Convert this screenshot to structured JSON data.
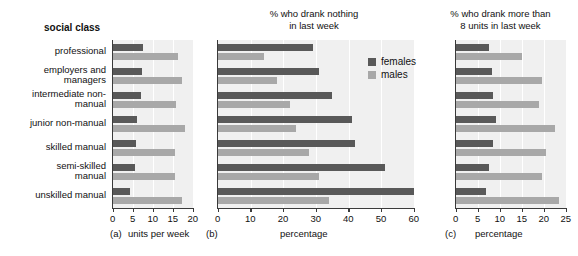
{
  "figure": {
    "categories": [
      "professional",
      "employers and managers",
      "intermediate non-manual",
      "junior non-manual",
      "skilled manual",
      "semi-skilled manual",
      "unskilled manual"
    ],
    "social_class_heading": "social class",
    "legend": {
      "females_label": "females",
      "males_label": "males",
      "females_color": "#595959",
      "males_color": "#a8a8a8"
    }
  },
  "chart_data": [
    {
      "type": "bar",
      "panel": "(a)",
      "title": "social class",
      "orientation": "horizontal",
      "categories": [
        "professional",
        "employers and managers",
        "intermediate non-manual",
        "junior non-manual",
        "skilled manual",
        "semi-skilled manual",
        "unskilled manual"
      ],
      "series": [
        {
          "name": "females",
          "values": [
            7.6,
            7.3,
            7.0,
            6.0,
            5.7,
            5.5,
            4.3
          ]
        },
        {
          "name": "males",
          "values": [
            16.3,
            17.2,
            15.8,
            18.0,
            15.5,
            15.4,
            17.2
          ]
        }
      ],
      "xlabel": "units per week",
      "ylabel": "",
      "xlim": [
        0,
        20
      ],
      "xticks": [
        0,
        5,
        10,
        15,
        20
      ],
      "grid": true,
      "legend_position": "none"
    },
    {
      "type": "bar",
      "panel": "(b)",
      "title": "% who drank nothing in last week",
      "title_line1": "% who drank nothing",
      "title_line2": "in last week",
      "orientation": "horizontal",
      "categories": [
        "professional",
        "employers and managers",
        "intermediate non-manual",
        "junior non-manual",
        "skilled manual",
        "semi-skilled manual",
        "unskilled manual"
      ],
      "series": [
        {
          "name": "females",
          "values": [
            29,
            31,
            35,
            41,
            42,
            51,
            60
          ]
        },
        {
          "name": "males",
          "values": [
            14,
            18,
            22,
            24,
            28,
            31,
            34
          ]
        }
      ],
      "xlabel": "percentage",
      "ylabel": "",
      "xlim": [
        0,
        60
      ],
      "xticks": [
        0,
        10,
        20,
        30,
        40,
        50,
        60
      ],
      "grid": true,
      "legend_position": "upper right"
    },
    {
      "type": "bar",
      "panel": "(c)",
      "title": "% who drank more than 8 units in last week",
      "title_line1": "% who drank more than",
      "title_line2": "8 units in last week",
      "orientation": "horizontal",
      "categories": [
        "professional",
        "employers and managers",
        "intermediate non-manual",
        "junior non-manual",
        "skilled manual",
        "semi-skilled manual",
        "unskilled manual"
      ],
      "series": [
        {
          "name": "females",
          "values": [
            7.5,
            8.2,
            8.4,
            9.0,
            8.5,
            7.5,
            6.8
          ]
        },
        {
          "name": "males",
          "values": [
            15.0,
            19.5,
            18.8,
            22.5,
            20.5,
            19.5,
            23.5
          ]
        }
      ],
      "xlabel": "percentage",
      "ylabel": "",
      "xlim": [
        0,
        25
      ],
      "xticks": [
        0,
        5,
        10,
        15,
        20,
        25
      ],
      "grid": true,
      "legend_position": "none"
    }
  ]
}
